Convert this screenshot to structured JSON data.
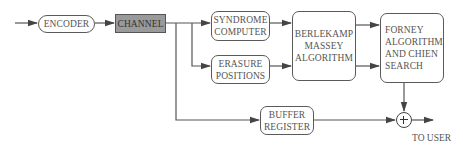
{
  "diagram": {
    "type": "block-diagram",
    "blocks": {
      "encoder": {
        "label": "ENCODER"
      },
      "channel": {
        "label": "CHANNEL"
      },
      "syndrome": {
        "label": "SYNDROME\nCOMPUTER"
      },
      "erasure": {
        "label": "ERASURE\nPOSITIONS"
      },
      "berlekamp": {
        "label": "BERLEKAMP\nMASSEY\nALGORITHM"
      },
      "forney": {
        "label": "FORNEY\nALGORITHM\nAND CHIEN\nSEARCH"
      },
      "buffer": {
        "label": "BUFFER\nREGISTER"
      }
    },
    "summing_junction": {
      "symbol": "+"
    },
    "output_label": "TO USER",
    "edges": [
      {
        "from": "input",
        "to": "encoder"
      },
      {
        "from": "encoder",
        "to": "channel"
      },
      {
        "from": "channel",
        "to": "syndrome"
      },
      {
        "from": "channel",
        "to": "erasure"
      },
      {
        "from": "channel",
        "to": "buffer"
      },
      {
        "from": "syndrome",
        "to": "berlekamp"
      },
      {
        "from": "erasure",
        "to": "berlekamp"
      },
      {
        "from": "berlekamp",
        "to": "forney"
      },
      {
        "from": "berlekamp",
        "to": "forney"
      },
      {
        "from": "forney",
        "to": "summing_junction"
      },
      {
        "from": "buffer",
        "to": "summing_junction"
      },
      {
        "from": "summing_junction",
        "to": "output"
      }
    ],
    "colors": {
      "line": "#555555",
      "channel_fill": "#9a9a9a",
      "box_border": "#5a5a5a"
    }
  }
}
